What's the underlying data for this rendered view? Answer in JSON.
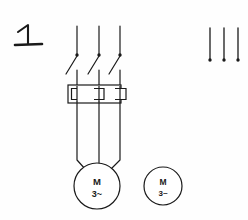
{
  "diagram": {
    "exercise_label": "1",
    "stroke_color": "#1a1a1a",
    "background_color": "#fefefe",
    "line_width": 1.1
  },
  "supply": {
    "name": "three-phase supply lines",
    "phase_count": 3,
    "phase_x": [
      77,
      99,
      120
    ],
    "top_y": 26,
    "terminal_y": 55,
    "terminal_dot_radius": 1.6
  },
  "contactor": {
    "name": "three pole contactor contacts",
    "pole_count": 3,
    "contact_top_y": 57,
    "contact_bottom_y": 73,
    "contact_dx": -12
  },
  "overload_relay": {
    "name": "thermal overload relay",
    "box_x": 68,
    "box_y": 85,
    "box_width": 53,
    "box_height": 18,
    "element_count": 3,
    "element_width": 13,
    "element_height": 11
  },
  "motor_primary": {
    "name": "three phase motor connected",
    "cx": 97,
    "cy": 186,
    "r": 23,
    "label_top": "M",
    "label_bottom": "3~",
    "lead_converge_y": 168
  },
  "motor_secondary": {
    "name": "three phase motor standalone",
    "cx": 163,
    "cy": 186,
    "r": 19,
    "label_top": "M",
    "label_bottom": "3~"
  },
  "right_lines": {
    "name": "isolated supply line stubs",
    "count": 3,
    "x": [
      210,
      224,
      238
    ],
    "top_y": 28,
    "bottom_y": 60,
    "dot_radius": 1.6
  }
}
